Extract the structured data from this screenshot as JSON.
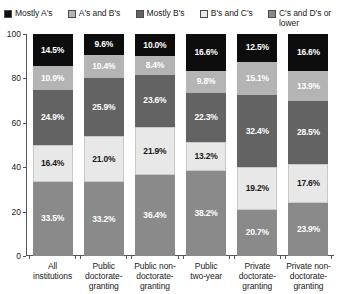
{
  "chart_data": {
    "type": "bar",
    "subtype": "stacked-bar-100",
    "title": "",
    "xlabel": "",
    "ylabel": "",
    "ylim": [
      0,
      100
    ],
    "yticks": [
      100,
      80,
      60,
      40,
      20,
      0
    ],
    "grid": false,
    "legend_position": "top",
    "categories": [
      "All institutions",
      "Public doctorate-granting",
      "Public non-doctorate-granting",
      "Public two-year",
      "Private doctorate-granting",
      "Private non-doctorate-granting"
    ],
    "series": [
      {
        "name": "Mostly A's",
        "color": "#0d0d0d",
        "label_color": "#ffffff",
        "values": [
          14.5,
          9.6,
          10.0,
          16.6,
          12.5,
          16.6
        ],
        "labels": [
          "14.5%",
          "9.6%",
          "10.0%",
          "16.6%",
          "12.5%",
          "16.6%"
        ]
      },
      {
        "name": "A's and B's",
        "color": "#b4b4b4",
        "label_color": "#ffffff",
        "values": [
          10.9,
          10.4,
          8.4,
          9.8,
          15.1,
          13.9
        ],
        "labels": [
          "10.9%",
          "10.4%",
          "8.4%",
          "9.8%",
          "15.1%",
          "13.9%"
        ]
      },
      {
        "name": "Mostly B's",
        "color": "#636363",
        "label_color": "#ffffff",
        "values": [
          24.9,
          25.9,
          23.6,
          22.3,
          32.4,
          28.5
        ],
        "labels": [
          "24.9%",
          "25.9%",
          "23.6%",
          "22.3%",
          "32.4%",
          "28.5%"
        ]
      },
      {
        "name": "B's and C's",
        "color": "#e8e8e8",
        "label_color": "#1a1a1a",
        "values": [
          16.4,
          21.0,
          21.9,
          13.2,
          19.2,
          17.6
        ],
        "labels": [
          "16.4%",
          "21.0%",
          "21.9%",
          "13.2%",
          "19.2%",
          "17.6%"
        ]
      },
      {
        "name": "C's and D's or lower",
        "color": "#8a8a8a",
        "label_color": "#ffffff",
        "values": [
          33.5,
          33.2,
          36.4,
          38.2,
          20.7,
          23.9
        ],
        "labels": [
          "33.5%",
          "33.2%",
          "36.4%",
          "38.2%",
          "20.7%",
          "23.9%"
        ]
      }
    ]
  },
  "legend": {
    "items": [
      {
        "label": "Mostly A's",
        "color": "#0d0d0d"
      },
      {
        "label": "A's and B's",
        "color": "#b4b4b4"
      },
      {
        "label": "Mostly B's",
        "color": "#636363"
      },
      {
        "label": "B's and C's",
        "color": "#e8e8e8"
      },
      {
        "label": "C's and D's or lower",
        "color": "#8a8a8a"
      }
    ]
  },
  "yaxis": {
    "ticks": [
      "100",
      "80",
      "60",
      "40",
      "20",
      "0"
    ]
  },
  "xaxis": {
    "labels": [
      "All\ninstitutions",
      "Public\ndoctorate-\ngranting",
      "Public non-\ndoctorate-\ngranting",
      "Public\ntwo-year",
      "Private\ndoctorate-\ngranting",
      "Private non-\ndoctorate-\ngranting"
    ]
  }
}
